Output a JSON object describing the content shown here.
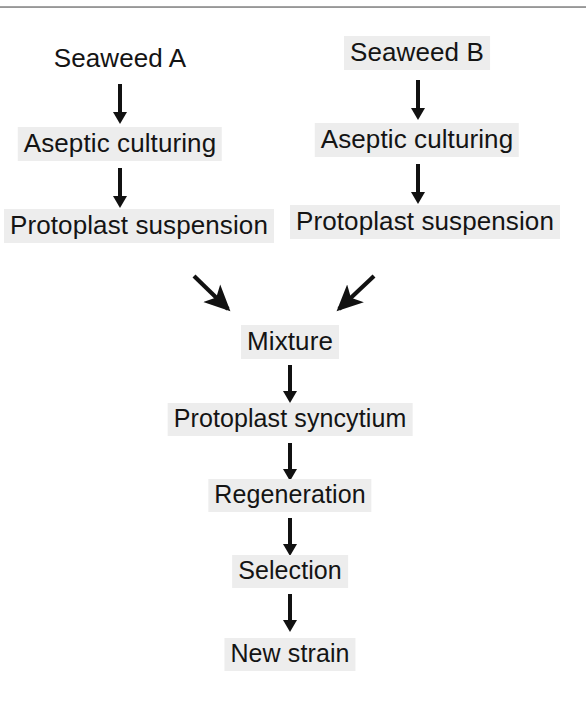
{
  "diagram": {
    "type": "flowchart",
    "orientation": "top-to-bottom",
    "text_color": "#141414",
    "highlight_color": "#ededed",
    "arrow_color": "#111111",
    "background_color": "#ffffff",
    "rule_color": "#8a8a8a"
  },
  "branches": {
    "left": {
      "name": "Seaweed A branch",
      "steps": [
        {
          "id": "seaweed-a",
          "label": "Seaweed A"
        },
        {
          "id": "aseptic-culturing-a",
          "label": "Aseptic culturing"
        },
        {
          "id": "protoplast-suspension-a",
          "label": "Protoplast suspension"
        }
      ]
    },
    "right": {
      "name": "Seaweed B branch",
      "steps": [
        {
          "id": "seaweed-b",
          "label": "Seaweed B"
        },
        {
          "id": "aseptic-culturing-b",
          "label": "Aseptic culturing"
        },
        {
          "id": "protoplast-suspension-b",
          "label": "Protoplast suspension"
        }
      ]
    }
  },
  "merged": {
    "name": "Merged fusion pathway",
    "steps": [
      {
        "id": "mixture",
        "label": "Mixture"
      },
      {
        "id": "protoplast-syncytium",
        "label": "Protoplast syncytium"
      },
      {
        "id": "regeneration",
        "label": "Regeneration"
      },
      {
        "id": "selection",
        "label": "Selection"
      },
      {
        "id": "new-strain",
        "label": "New strain"
      }
    ]
  },
  "connectors": [
    {
      "id": "arrow-seaweed-a-to-culturing",
      "kind": "vertical-arrow",
      "from": "seaweed-a",
      "to": "aseptic-culturing-a"
    },
    {
      "id": "arrow-culturing-a-to-suspension",
      "kind": "vertical-arrow",
      "from": "aseptic-culturing-a",
      "to": "protoplast-suspension-a"
    },
    {
      "id": "arrow-seaweed-b-to-culturing",
      "kind": "vertical-arrow",
      "from": "seaweed-b",
      "to": "aseptic-culturing-b"
    },
    {
      "id": "arrow-culturing-b-to-suspension",
      "kind": "vertical-arrow",
      "from": "aseptic-culturing-b",
      "to": "protoplast-suspension-b"
    },
    {
      "id": "arrow-suspension-a-to-mixture",
      "kind": "diagonal-arrow",
      "from": "protoplast-suspension-a",
      "to": "mixture"
    },
    {
      "id": "arrow-suspension-b-to-mixture",
      "kind": "diagonal-arrow",
      "from": "protoplast-suspension-b",
      "to": "mixture"
    },
    {
      "id": "arrow-mixture-to-syncytium",
      "kind": "vertical-arrow",
      "from": "mixture",
      "to": "protoplast-syncytium"
    },
    {
      "id": "arrow-syncytium-to-regeneration",
      "kind": "vertical-arrow",
      "from": "protoplast-syncytium",
      "to": "regeneration"
    },
    {
      "id": "arrow-regeneration-to-selection",
      "kind": "vertical-arrow",
      "from": "regeneration",
      "to": "selection"
    },
    {
      "id": "arrow-selection-to-new-strain",
      "kind": "vertical-arrow",
      "from": "selection",
      "to": "new-strain"
    }
  ]
}
